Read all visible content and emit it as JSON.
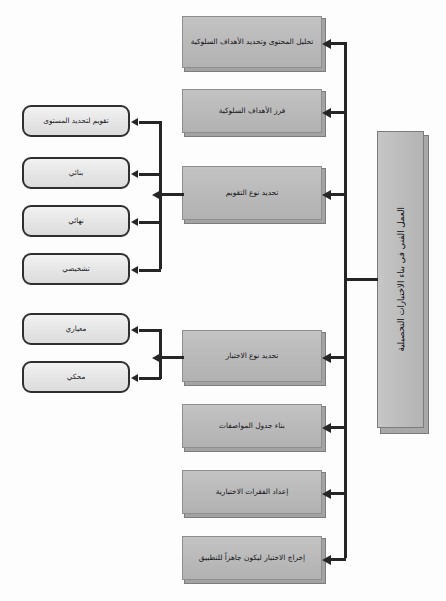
{
  "diagram": {
    "title_bar": {
      "label": "العمل الفني في بناء الاختبارات التحصيلية",
      "orientation": "vertical-rtl"
    },
    "process_steps": [
      {
        "id": "content-analysis",
        "label": "تحليل المحتوى وتحديد الأهداف السلوكية"
      },
      {
        "id": "sort-objectives",
        "label": "فرز الأهداف السلوكية"
      },
      {
        "id": "evaluation-type",
        "label": "تحديد نوع التقويم"
      },
      {
        "id": "test-type",
        "label": "تحديد نوع الاختبار"
      },
      {
        "id": "spec-table",
        "label": "بناء جدول المواصفات"
      },
      {
        "id": "prepare-items",
        "label": "إعداد الفقرات الاختبارية"
      },
      {
        "id": "finalize-test",
        "label": "إخراج الاختبار ليكون جاهزاً للتطبيق"
      }
    ],
    "evaluation_types": [
      {
        "id": "placement",
        "label": "تقويم لتحديد المستوى"
      },
      {
        "id": "formative",
        "label": "بنائي"
      },
      {
        "id": "summative",
        "label": "نهائي"
      },
      {
        "id": "diagnostic",
        "label": "تشخيصي"
      }
    ],
    "test_types": [
      {
        "id": "norm-referenced",
        "label": "معياري"
      },
      {
        "id": "criterion-referenced",
        "label": "محكي"
      }
    ],
    "colors": {
      "process_fill": "#bdbdbd",
      "leaf_fill": "#e8e8e8",
      "line": "#262626",
      "border_dark": "#2f2f2f",
      "page_bg": "#fdfdfd"
    }
  }
}
